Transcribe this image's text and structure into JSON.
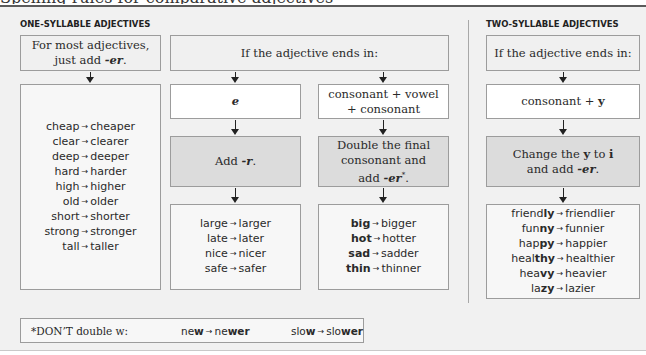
{
  "clipped_heading": "Spelling rules for comparative adjectives",
  "one_syllable": {
    "title": "ONE-SYLLABLE ADJECTIVES",
    "rule_line1": "For most adjectives,",
    "rule_line2_prefix": "just add ",
    "rule_suffix": "-er",
    "rule_end": ".",
    "examples": [
      {
        "base": "cheap",
        "comparative": "cheaper"
      },
      {
        "base": "clear",
        "comparative": "clearer"
      },
      {
        "base": "deep",
        "comparative": "deeper"
      },
      {
        "base": "hard",
        "comparative": "harder"
      },
      {
        "base": "high",
        "comparative": "higher"
      },
      {
        "base": "old",
        "comparative": "older"
      },
      {
        "base": "short",
        "comparative": "shorter"
      },
      {
        "base": "strong",
        "comparative": "stronger"
      },
      {
        "base": "tall",
        "comparative": "taller"
      }
    ],
    "ends_in_header": "If the adjective ends in:",
    "branch_e": {
      "ending": "e",
      "rule_prefix": "Add ",
      "rule_suffix": "-r",
      "rule_end": ".",
      "examples": [
        {
          "base": "large",
          "comparative": "larger"
        },
        {
          "base": "late",
          "comparative": "later"
        },
        {
          "base": "nice",
          "comparative": "nicer"
        },
        {
          "base": "safe",
          "comparative": "safer"
        }
      ]
    },
    "branch_cvc": {
      "ending_line1": "consonant + vowel",
      "ending_line2": "+ consonant",
      "rule_line1": "Double the final",
      "rule_line2": "consonant and",
      "rule_line3_prefix": "add ",
      "rule_suffix": "-er",
      "rule_mark": "*",
      "rule_end": ".",
      "examples": [
        {
          "base": "big",
          "comparative": "bigger"
        },
        {
          "base": "hot",
          "comparative": "hotter"
        },
        {
          "base": "sad",
          "comparative": "sadder"
        },
        {
          "base": "thin",
          "comparative": "thinner"
        }
      ]
    }
  },
  "two_syllable": {
    "title": "TWO-SYLLABLE ADJECTIVES",
    "ends_in_header": "If the adjective ends in:",
    "ending_prefix": "consonant + ",
    "ending_letter": "y",
    "rule_line1_prefix": "Change the ",
    "rule_from": "y",
    "rule_mid": " to ",
    "rule_to": "i",
    "rule_line2_prefix": "and add ",
    "rule_suffix": "-er",
    "rule_end": ".",
    "examples": [
      {
        "stem": "friend",
        "ending": "ly",
        "comparative": "friendlier"
      },
      {
        "stem": "fun",
        "ending": "ny",
        "comparative": "funnier"
      },
      {
        "stem": "hap",
        "ending": "py",
        "comparative": "happier"
      },
      {
        "stem": "heal",
        "ending": "thy",
        "comparative": "healthier"
      },
      {
        "stem": "hea",
        "ending": "vy",
        "comparative": "heavier"
      },
      {
        "stem": "la",
        "ending": "zy",
        "comparative": "lazier"
      }
    ]
  },
  "footnote": {
    "text": "*DON’T double w:",
    "examples": [
      {
        "base": "new",
        "comparative_stem": "ne",
        "comparative_bold": "wer"
      },
      {
        "base": "slow",
        "comparative_stem": "slo",
        "comparative_bold": "wer"
      }
    ]
  },
  "arrow_glyph": "→"
}
